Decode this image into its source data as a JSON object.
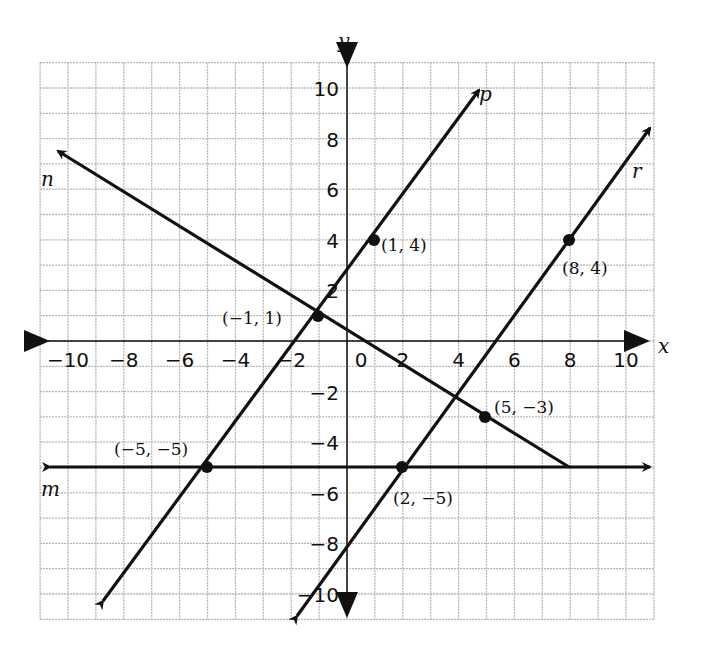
{
  "chart_data": {
    "type": "line",
    "title": "",
    "xlabel": "x",
    "ylabel": "y",
    "xlim": [
      -11,
      11
    ],
    "ylim": [
      -11,
      11
    ],
    "grid": true,
    "x_ticks": [
      "−10",
      "−8",
      "−6",
      "−4",
      "−2",
      "0",
      "2",
      "4",
      "6",
      "8",
      "10"
    ],
    "y_ticks": [
      "10",
      "8",
      "6",
      "4",
      "2",
      "0",
      "−2",
      "−4",
      "−6",
      "−8",
      "−10"
    ],
    "series": [
      {
        "name": "p",
        "points": [
          [
            -1,
            1
          ],
          [
            1,
            4
          ]
        ],
        "kind": "line",
        "arrows": "both"
      },
      {
        "name": "r",
        "points": [
          [
            2,
            -5
          ],
          [
            8,
            4
          ]
        ],
        "kind": "line",
        "arrows": "both"
      },
      {
        "name": "n",
        "points": [
          [
            -1,
            1
          ],
          [
            5,
            -3
          ]
        ],
        "kind": "ray-segment",
        "from": [
          8,
          -5
        ],
        "toward": [
          -11,
          7.67
        ]
      },
      {
        "name": "m",
        "points": [
          [
            -5,
            -5
          ],
          [
            2,
            -5
          ]
        ],
        "kind": "line",
        "arrows": "both",
        "equation": "y = -5"
      }
    ],
    "labeled_points": [
      {
        "x": -1,
        "y": 1,
        "label": "(−1, 1)"
      },
      {
        "x": 1,
        "y": 4,
        "label": "(1, 4)"
      },
      {
        "x": 8,
        "y": 4,
        "label": "(8, 4)"
      },
      {
        "x": 5,
        "y": -3,
        "label": "(5, −3)"
      },
      {
        "x": -5,
        "y": -5,
        "label": "(−5, −5)"
      },
      {
        "x": 2,
        "y": -5,
        "label": "(2, −5)"
      }
    ],
    "line_labels": {
      "p": "p",
      "r": "r",
      "n": "n",
      "m": "m"
    }
  },
  "labels": {
    "x_axis": "x",
    "y_axis": "y",
    "line_p": "p",
    "line_r": "r",
    "line_n": "n",
    "line_m": "m",
    "pt_a": "(−1, 1)",
    "pt_b": "(1, 4)",
    "pt_c": "(8, 4)",
    "pt_d": "(5, −3)",
    "pt_e": "(−5, −5)",
    "pt_f": "(2, −5)"
  },
  "colors": {
    "grid": "#b5b5b5",
    "ink": "#111111"
  }
}
